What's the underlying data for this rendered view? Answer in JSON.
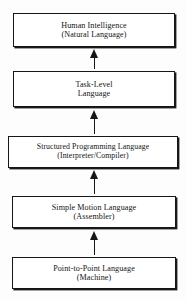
{
  "diagram": {
    "orientation": "bottom-to-top",
    "arrow_direction": "upward",
    "colors": {
      "background": "#fdfdfd",
      "box_fill": "#ffffff",
      "ink": "#161616"
    },
    "levels": [
      {
        "id": "level-5",
        "rank": 5,
        "line1": "Human Intelligence",
        "line2": "(Natural Language)"
      },
      {
        "id": "level-4",
        "rank": 4,
        "line1": "Task-Level",
        "line2": "Language"
      },
      {
        "id": "level-3",
        "rank": 3,
        "line1": "Structured Programming Language",
        "line2": "(Interpreter/Compiler)"
      },
      {
        "id": "level-2",
        "rank": 2,
        "line1": "Simple Motion Language",
        "line2": "(Assembler)"
      },
      {
        "id": "level-1",
        "rank": 1,
        "line1": "Point-to-Point Language",
        "line2": "(Machine)"
      }
    ],
    "connectors": [
      {
        "id": "arrow-1-2",
        "from": "level-1",
        "to": "level-2",
        "icon": "up-arrow-icon"
      },
      {
        "id": "arrow-2-3",
        "from": "level-2",
        "to": "level-3",
        "icon": "up-arrow-icon"
      },
      {
        "id": "arrow-3-4",
        "from": "level-3",
        "to": "level-4",
        "icon": "up-arrow-icon"
      },
      {
        "id": "arrow-4-5",
        "from": "level-4",
        "to": "level-5",
        "icon": "up-arrow-icon"
      }
    ]
  }
}
